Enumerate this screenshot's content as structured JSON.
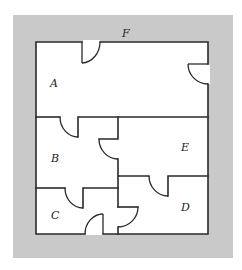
{
  "diagram": {
    "type": "floor-plan",
    "outside_label": "F",
    "rooms": [
      {
        "id": "A",
        "label": "A"
      },
      {
        "id": "B",
        "label": "B"
      },
      {
        "id": "C",
        "label": "C"
      },
      {
        "id": "D",
        "label": "D"
      },
      {
        "id": "E",
        "label": "E"
      }
    ],
    "doors": [
      {
        "between": [
          "A",
          "F"
        ],
        "wall": "top"
      },
      {
        "between": [
          "A",
          "F"
        ],
        "wall": "right"
      },
      {
        "between": [
          "A",
          "B"
        ]
      },
      {
        "between": [
          "B",
          "E"
        ]
      },
      {
        "between": [
          "B",
          "C"
        ]
      },
      {
        "between": [
          "E",
          "D"
        ]
      },
      {
        "between": [
          "C",
          "D"
        ]
      },
      {
        "between": [
          "C",
          "F"
        ],
        "wall": "bottom"
      }
    ],
    "colors": {
      "outside": "#c9c9c9",
      "inside": "#ffffff",
      "wall": "#2a2a2a"
    }
  }
}
